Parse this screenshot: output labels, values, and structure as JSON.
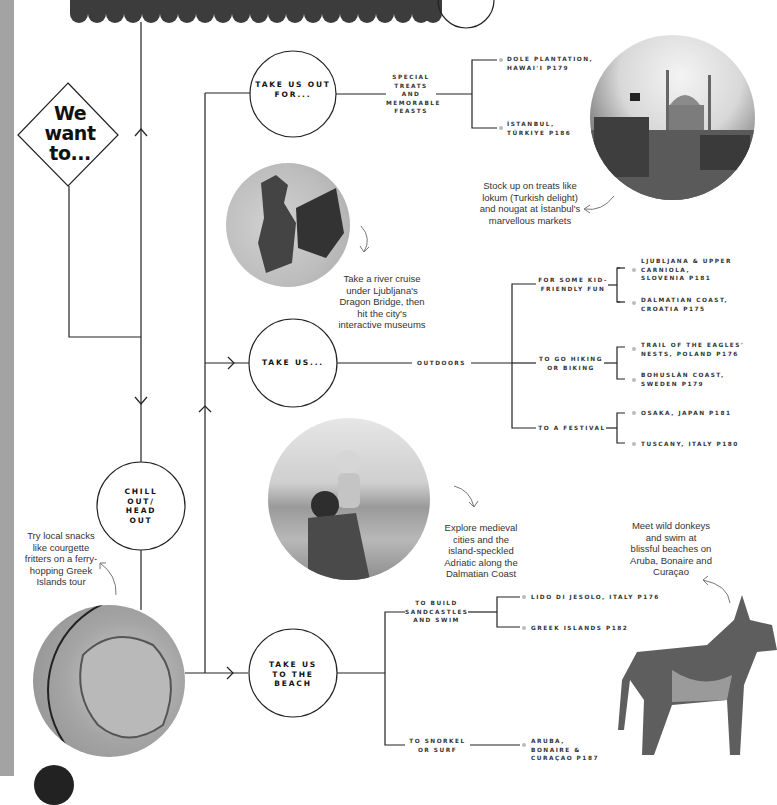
{
  "start": {
    "label": "We want to..."
  },
  "nodes": {
    "take_us_out_for": {
      "label": "TAKE US OUT FOR..."
    },
    "take_us": {
      "label": "TAKE US..."
    },
    "chill_out": {
      "label": "CHILL OUT/ HEAD OUT"
    },
    "take_us_beach": {
      "label": "TAKE US TO THE BEACH"
    }
  },
  "branches": {
    "special_treats": {
      "label": "SPECIAL TREATS AND MEMORABLE FEASTS",
      "leaves": [
        "DOLE PLANTATION, HAWAI'I P179",
        "İSTANBUL, TÜRKIYE P186"
      ]
    },
    "outdoors": {
      "label": "OUTDOORS"
    },
    "kid_friendly": {
      "label": "FOR SOME KID-FRIENDLY FUN",
      "leaves": [
        "LJUBLJANA & UPPER CARNIOLA, SLOVENIA P181",
        "DALMATIAN COAST, CROATIA P175"
      ]
    },
    "hiking": {
      "label": "TO GO HIKING OR BIKING",
      "leaves": [
        "TRAIL OF THE EAGLES' NESTS, POLAND P176",
        "BOHUSLÄN COAST, SWEDEN P179"
      ]
    },
    "festival": {
      "label": "TO A FESTIVAL",
      "leaves": [
        "OSAKA, JAPAN P181",
        "TUSCANY, ITALY P180"
      ]
    },
    "sandcastles": {
      "label": "TO BUILD SANDCASTLES AND SWIM",
      "leaves": [
        "LIDO DI JESOLO, ITALY P176",
        "GREEK ISLANDS P182"
      ]
    },
    "snorkel": {
      "label": "TO SNORKEL OR SURF",
      "leaves": [
        "ARUBA, BONAIRE & CURAÇAO P187"
      ]
    }
  },
  "captions": {
    "istanbul": "Stock up on treats like lokum (Turkish delight) and nougat at İstanbul's marvellous markets",
    "dragon": "Take a river cruise under Ljubljana's Dragon Bridge, then hit the city's interactive museums",
    "dalmatian": "Explore medieval cities and the island-speckled Adriatic along the Dalmatian Coast",
    "greek": "Try local snacks like courgette fritters on a ferry-hopping Greek Islands tour",
    "donkey": "Meet wild donkeys and swim at blissful beaches on Aruba, Bonaire and Curaçao"
  },
  "photos": {
    "istanbul": "istanbul-mosque-market-photo",
    "dragon": "dragon-statue-photo",
    "dalmatian": "father-child-coast-photo",
    "greek": "courgette-fritters-photo",
    "donkey": "donkey-photo"
  }
}
